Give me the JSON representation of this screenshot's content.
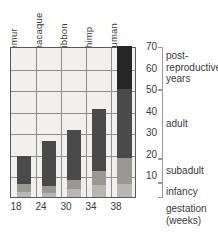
{
  "chart_data": {
    "type": "bar",
    "title": "",
    "xlabel": "gestation (weeks)",
    "ylabel": "years",
    "ylim": [
      0,
      70
    ],
    "ytick_labels": [
      "70",
      "60",
      "50",
      "40",
      "30",
      "20",
      "10"
    ],
    "ytick_values": [
      70,
      60,
      50,
      40,
      30,
      20,
      10
    ],
    "grid": true,
    "legend_position": "right",
    "stacked": true,
    "categories": [
      "lemur",
      "macaque",
      "gibbon",
      "chimp",
      "human"
    ],
    "x": [
      18,
      24,
      30,
      34,
      38
    ],
    "xtick_labels": [
      "18",
      "24",
      "30",
      "34",
      "38"
    ],
    "series": [
      {
        "name": "infancy",
        "values": [
          2.5,
          2.0,
          3.5,
          5.5,
          6.0
        ],
        "color": "#b8b6b2"
      },
      {
        "name": "subadult",
        "values": [
          3.5,
          3.0,
          4.5,
          6.5,
          12.0
        ],
        "color": "#9a9894"
      },
      {
        "name": "adult",
        "values": [
          13.0,
          21.0,
          23.0,
          29.0,
          32.0
        ],
        "color": "#4a4a4a"
      },
      {
        "name": "post-reproductive",
        "values": [
          0,
          0,
          0,
          0,
          20.0
        ],
        "color": "#262626"
      }
    ],
    "totals": [
      19,
      26,
      31,
      41,
      70
    ],
    "annotations": [
      {
        "label": "post-reproductive years",
        "from": 50,
        "to": 70
      },
      {
        "label": "adult",
        "from": 18,
        "to": 50
      },
      {
        "label": "subadult",
        "from": 7,
        "to": 18
      },
      {
        "label": "infancy",
        "from": 0,
        "to": 7
      }
    ]
  },
  "labels": {
    "species": [
      "lemur",
      "macaque",
      "gibbon",
      "chimp",
      "human"
    ],
    "yticks": [
      "70",
      "60",
      "50",
      "40",
      "30",
      "20",
      "10"
    ],
    "xticks": [
      "18",
      "24",
      "30",
      "34",
      "38"
    ],
    "stage_post_line1": "post-",
    "stage_post_line2": "reproductive",
    "stage_post_line3": "years",
    "stage_adult": "adult",
    "stage_subadult": "subadult",
    "stage_infancy": "infancy",
    "xcaption_line1": "gestation",
    "xcaption_line2": "(weeks)"
  },
  "colors": {
    "plot_bg": "#f2f0ee",
    "frame": "#5a5a5a",
    "grid": "#8d8d8d",
    "infancy": "#b8b6b2",
    "subadult": "#9a9894",
    "adult": "#4a4a4a",
    "post": "#262626",
    "text": "#3a3a3a",
    "bracket": "#9a9a9a"
  }
}
